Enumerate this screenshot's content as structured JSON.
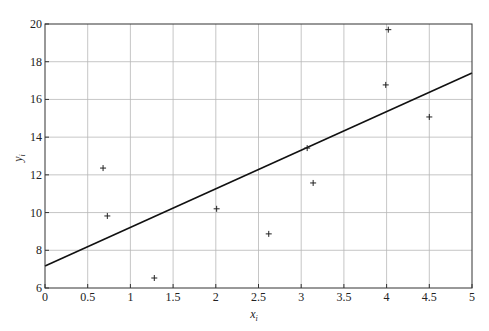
{
  "chart_data": {
    "type": "scatter",
    "title": "",
    "xlabel": "x_i",
    "ylabel": "y_i",
    "xlim": [
      0,
      5
    ],
    "ylim": [
      6,
      20
    ],
    "grid": true,
    "legend": null,
    "x_ticks": [
      0,
      0.5,
      1,
      1.5,
      2,
      2.5,
      3,
      3.5,
      4,
      4.5,
      5
    ],
    "x_tick_labels": [
      "0",
      "0.5",
      "1",
      "1.5",
      "2",
      "2.5",
      "3",
      "3.5",
      "4",
      "4.5",
      "5"
    ],
    "y_ticks": [
      6,
      8,
      10,
      12,
      14,
      16,
      18,
      20
    ],
    "y_tick_labels": [
      "6",
      "8",
      "10",
      "12",
      "14",
      "16",
      "18",
      "20"
    ],
    "series": [
      {
        "name": "data points",
        "type": "scatter",
        "marker": "+",
        "x": [
          0.68,
          0.73,
          1.28,
          2.01,
          2.62,
          3.07,
          3.14,
          3.99,
          4.02,
          4.5
        ],
        "y": [
          12.36,
          9.82,
          6.53,
          10.2,
          8.87,
          13.42,
          11.57,
          16.77,
          19.7,
          15.07
        ]
      },
      {
        "name": "fitted line",
        "type": "line",
        "x": [
          0,
          5
        ],
        "y": [
          7.17,
          17.4
        ]
      }
    ]
  },
  "labels": {
    "xlabel_main": "x",
    "xlabel_sub": "i",
    "ylabel_main": "y",
    "ylabel_sub": "i"
  }
}
